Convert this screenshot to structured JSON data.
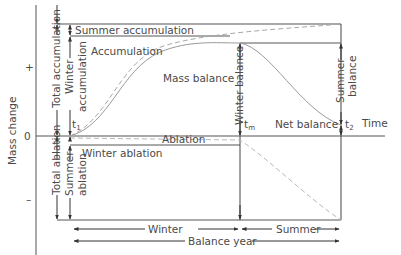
{
  "axes": {
    "y_label": "Mass change",
    "y_ticks": [
      "+",
      "0",
      "–"
    ],
    "x_label": "Time"
  },
  "time_markers": {
    "t1": {
      "base": "t",
      "sub": "1"
    },
    "tm": {
      "base": "t",
      "sub": "m"
    },
    "t2": {
      "base": "t",
      "sub": "2"
    }
  },
  "labels": {
    "summer_accumulation": "Summer accumulation",
    "accumulation": "Accumulation",
    "mass_balance": "Mass balance",
    "net_balance": "Net balance",
    "ablation": "Ablation",
    "winter_ablation": "Winter ablation",
    "total_accumulation": "Total accumulation",
    "winter_accumulation_line1": "Winter",
    "winter_accumulation_line2": "accumulation",
    "total_ablation": "Total ablation",
    "summer_ablation_line1": "Summer",
    "summer_ablation_line2": "ablation",
    "winter_balance": "Winter balance",
    "summer_balance_line1": "Summer",
    "summer_balance_line2": "balance"
  },
  "periods": {
    "winter": "Winter",
    "summer": "Summer",
    "balance_year": "Balance year"
  },
  "colors": {
    "line": "#3c3c3c",
    "curve_solid": "#9a9a9a",
    "curve_dashed": "#a8a8a8",
    "text": "#4a4a4a"
  }
}
